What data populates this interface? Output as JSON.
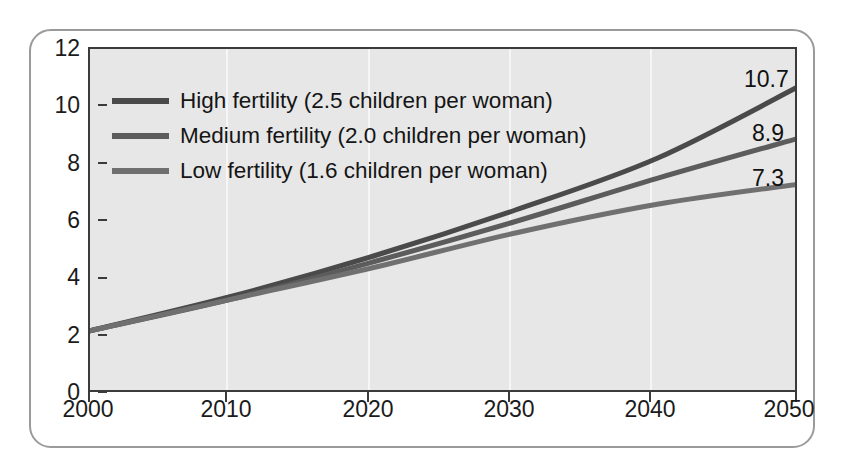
{
  "chart_data": {
    "type": "line",
    "title": "",
    "xlabel": "",
    "ylabel": "",
    "xlim": [
      2000,
      2050
    ],
    "ylim": [
      0,
      12
    ],
    "grid": true,
    "legend_position": "top-left inside plot",
    "x": [
      2000,
      2010,
      2020,
      2030,
      2040,
      2050
    ],
    "xticklabels": [
      "2000",
      "2010",
      "2020",
      "2030",
      "2040",
      "2050"
    ],
    "yticks": [
      0,
      2,
      4,
      6,
      8,
      10,
      12
    ],
    "yticklabels": [
      "0",
      "2",
      "4",
      "6",
      "8",
      "10",
      "12"
    ],
    "series": [
      {
        "name": "High fertility (2.5 children per woman)",
        "short_name": "High fertility",
        "annotation": "2.5 children per woman",
        "color": "#4a4a4a",
        "values": [
          2.2,
          3.4,
          4.8,
          6.4,
          8.2,
          10.7
        ],
        "end_label": "10.7"
      },
      {
        "name": "Medium fertility (2.0 children per woman)",
        "short_name": "Medium fertility",
        "annotation": "2.0 children per woman",
        "color": "#5c5c5c",
        "values": [
          2.2,
          3.3,
          4.6,
          6.0,
          7.5,
          8.9
        ],
        "end_label": "8.9"
      },
      {
        "name": "Low fertility (1.6 children per woman)",
        "short_name": "Low fertility",
        "annotation": "1.6 children per woman",
        "color": "#707070",
        "values": [
          2.2,
          3.3,
          4.4,
          5.6,
          6.6,
          7.3
        ],
        "end_label": "7.3"
      }
    ],
    "end_labels": [
      "10.7",
      "8.9",
      "7.3"
    ]
  },
  "legend": {
    "items": [
      {
        "label": "High fertility (2.5 children per woman)",
        "color": "#4a4a4a"
      },
      {
        "label": "Medium fertility (2.0 children per woman)",
        "color": "#5c5c5c"
      },
      {
        "label": "Low fertility (1.6 children per woman)",
        "color": "#707070"
      }
    ]
  },
  "axes": {
    "y_ticks": [
      "12",
      "10",
      "8",
      "6",
      "4",
      "2",
      "0"
    ],
    "x_ticks": [
      "2000",
      "2010",
      "2020",
      "2030",
      "2040",
      "2050"
    ]
  },
  "colors": {
    "plot_background": "#e7e7e7",
    "page_background": "#ffffff",
    "axis": "#3b3b3b",
    "frame_border": "#9a9a9a",
    "gridline": "#f6f6f6",
    "text": "#1b1b1b"
  }
}
